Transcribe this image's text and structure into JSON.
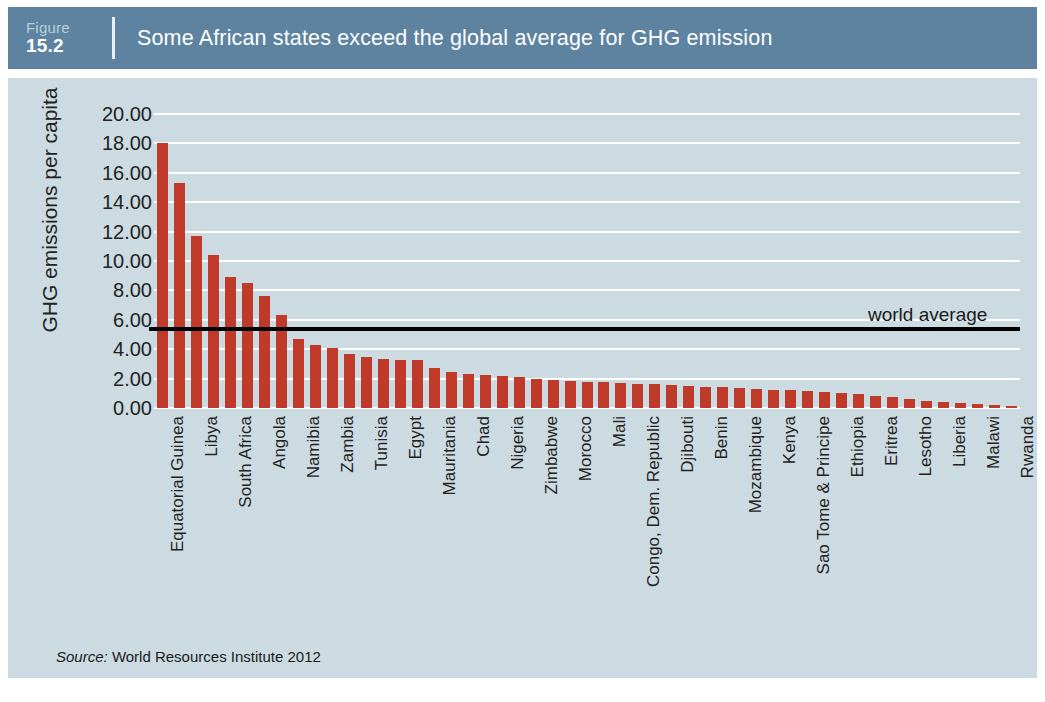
{
  "header": {
    "figure_word": "Figure",
    "figure_number": "15.2",
    "title": "Some African states exceed the global average for GHG emission"
  },
  "source": {
    "label": "Source:",
    "text": "World Resources Institute 2012"
  },
  "colors": {
    "banner": "#5d83a0",
    "panel_background": "#ccdae2",
    "bar": "#bf3a28",
    "gridline": "#ffffff",
    "average_line": "#000000",
    "text": "#222222"
  },
  "chart_data": {
    "type": "bar",
    "title": "Some African states exceed the global average for GHG emission",
    "xlabel": "",
    "ylabel": "GHG emissions per capita",
    "ylim": [
      0,
      20
    ],
    "ytick_labels": [
      "0.00",
      "2.00",
      "4.00",
      "6.00",
      "8.00",
      "10.00",
      "12.00",
      "14.00",
      "16.00",
      "18.00",
      "20.00"
    ],
    "ytick_values": [
      0,
      2,
      4,
      6,
      8,
      10,
      12,
      14,
      16,
      18,
      20
    ],
    "grid": true,
    "legend": "none",
    "annotations": [
      {
        "name": "world-average",
        "label": "world average",
        "value": 5.4,
        "style": "horizontal-line"
      }
    ],
    "categories": [
      "Equatorial Guinea",
      "Seychelles",
      "Libya",
      "Mauritius",
      "South Africa",
      "Botswana",
      "Angola",
      "Algeria",
      "Namibia",
      "Gabon",
      "Zambia",
      "Congo, Rep.",
      "Tunisia",
      "Cameroon",
      "Egypt",
      "Swaziland",
      "Mauritania",
      "Central African Republic",
      "Chad",
      "Cote d'Ivoire",
      "Nigeria",
      "Sudan",
      "Zimbabwe",
      "Ghana",
      "Morocco",
      "Senegal",
      "Mali",
      "Guinea-Bissau",
      "Congo, Dem. Republic",
      "Tanzania",
      "Djibouti",
      "Gambia",
      "Benin",
      "Burkina Faso",
      "Mozambique",
      "Madagascar",
      "Kenya",
      "Niger",
      "Sao Tome & Principe",
      "Guinea",
      "Ethiopia",
      "Sierra Leone",
      "Eritrea",
      "Togo",
      "Lesotho",
      "Comoros",
      "Liberia",
      "Uganda",
      "Malawi",
      "Burundi",
      "Rwanda"
    ],
    "values": [
      18.0,
      15.3,
      11.7,
      10.4,
      8.9,
      8.5,
      7.6,
      6.3,
      4.7,
      4.3,
      4.05,
      3.7,
      3.5,
      3.35,
      3.3,
      3.25,
      2.7,
      2.45,
      2.3,
      2.25,
      2.2,
      2.1,
      2.0,
      1.9,
      1.85,
      1.8,
      1.75,
      1.7,
      1.65,
      1.6,
      1.55,
      1.5,
      1.45,
      1.4,
      1.35,
      1.3,
      1.25,
      1.2,
      1.15,
      1.1,
      1.05,
      0.95,
      0.85,
      0.72,
      0.6,
      0.5,
      0.42,
      0.35,
      0.28,
      0.22,
      0.15
    ],
    "visible_tick_labels": [
      {
        "index": 0,
        "label": "Equatorial Guinea"
      },
      {
        "index": 2,
        "label": "Libya"
      },
      {
        "index": 4,
        "label": "South Africa"
      },
      {
        "index": 6,
        "label": "Angola"
      },
      {
        "index": 8,
        "label": "Namibia"
      },
      {
        "index": 10,
        "label": "Zambia"
      },
      {
        "index": 12,
        "label": "Tunisia"
      },
      {
        "index": 14,
        "label": "Egypt"
      },
      {
        "index": 16,
        "label": "Mauritania"
      },
      {
        "index": 18,
        "label": "Chad"
      },
      {
        "index": 20,
        "label": "Nigeria"
      },
      {
        "index": 22,
        "label": "Zimbabwe"
      },
      {
        "index": 24,
        "label": "Morocco"
      },
      {
        "index": 26,
        "label": "Mali"
      },
      {
        "index": 28,
        "label": "Congo, Dem. Republic"
      },
      {
        "index": 30,
        "label": "Djibouti"
      },
      {
        "index": 32,
        "label": "Benin"
      },
      {
        "index": 34,
        "label": "Mozambique"
      },
      {
        "index": 36,
        "label": "Kenya"
      },
      {
        "index": 38,
        "label": "Sao Tome & Principe"
      },
      {
        "index": 40,
        "label": "Ethiopia"
      },
      {
        "index": 42,
        "label": "Eritrea"
      },
      {
        "index": 44,
        "label": "Lesotho"
      },
      {
        "index": 46,
        "label": "Liberia"
      },
      {
        "index": 48,
        "label": "Malawi"
      },
      {
        "index": 50,
        "label": "Rwanda"
      }
    ]
  }
}
